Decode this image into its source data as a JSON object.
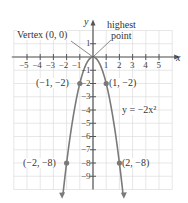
{
  "chart_data": {
    "type": "line",
    "title": "",
    "equation_label": "y = −2x²",
    "function": "y = -2x^2",
    "xlabel": "x",
    "ylabel": "y",
    "xlim": [
      -6,
      6
    ],
    "ylim": [
      -10,
      2
    ],
    "grid": true,
    "x_ticks": [
      "−5",
      "−4",
      "−3",
      "−2",
      "−1",
      "1",
      "2",
      "3",
      "4",
      "5"
    ],
    "x_tick_values": [
      -5,
      -4,
      -3,
      -2,
      -1,
      1,
      2,
      3,
      4,
      5
    ],
    "y_ticks": [
      "1",
      "−1",
      "−2",
      "−3",
      "−4",
      "−5",
      "−6",
      "−7",
      "−8",
      "−9"
    ],
    "y_tick_values": [
      1,
      -1,
      -2,
      -3,
      -4,
      -5,
      -6,
      -7,
      -8,
      -9
    ],
    "points": [
      {
        "x": -2,
        "y": -8,
        "label": "(−2, −8)"
      },
      {
        "x": -1,
        "y": -2,
        "label": "(−1, −2)"
      },
      {
        "x": 0,
        "y": 0,
        "label": "Vertex (0, 0)"
      },
      {
        "x": 1,
        "y": -2,
        "label": "(1, −2)"
      },
      {
        "x": 2,
        "y": -8,
        "label": "(2, −8)"
      }
    ],
    "annotations": [
      {
        "text": "Vertex (0, 0)",
        "target": [
          0,
          0
        ]
      },
      {
        "text": "highest point",
        "target": [
          0,
          0
        ]
      }
    ],
    "colors": {
      "curve": "#7a7a7a",
      "axis": "#555555",
      "grid": "#d9d9d9"
    }
  },
  "labels": {
    "vertex": "Vertex (0, 0)",
    "highest_1": "highest",
    "highest_2": "point",
    "p_m1": "(−1, −2)",
    "p_1": "(1, −2)",
    "p_m2": "(−2, −8)",
    "p_2": "(2, −8)",
    "equation": "y = −2x²",
    "x_axis": "x",
    "y_axis": "y"
  }
}
